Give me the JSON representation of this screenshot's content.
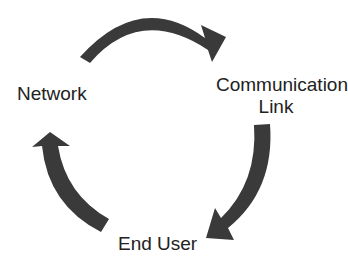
{
  "diagram": {
    "type": "cycle",
    "nodes": [
      {
        "id": "network",
        "label": "Network"
      },
      {
        "id": "comm_link",
        "label_line1": "Communication",
        "label_line2": "Link"
      },
      {
        "id": "end_user",
        "label": "End User"
      }
    ],
    "edges": [
      {
        "from": "network",
        "to": "comm_link",
        "shape": "curved-arrow-clockwise"
      },
      {
        "from": "comm_link",
        "to": "end_user",
        "shape": "curved-arrow-clockwise"
      },
      {
        "from": "end_user",
        "to": "network",
        "shape": "curved-arrow-clockwise"
      }
    ],
    "colors": {
      "arrow": "#3a3a3a",
      "text": "#222222",
      "background": "#ffffff"
    }
  }
}
